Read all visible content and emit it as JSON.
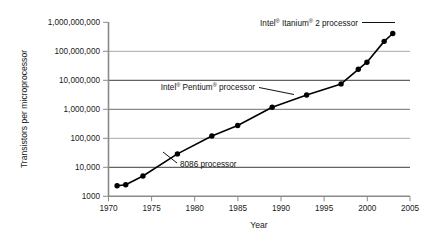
{
  "chart_data": {
    "type": "line",
    "title": "",
    "subtitle": "",
    "xlabel": "Year",
    "ylabel": "Transistors per microprocessor",
    "xlim": [
      1970,
      2005
    ],
    "ylim": [
      1000,
      1000000000
    ],
    "yscale": "log",
    "xscale": "linear",
    "grid": "horizontal",
    "legend": "none",
    "xticks": [
      "1970",
      "1975",
      "1980",
      "1985",
      "1990",
      "1995",
      "2000",
      "2005"
    ],
    "xtick_values": [
      1970,
      1975,
      1980,
      1985,
      1990,
      1995,
      2000,
      2005
    ],
    "yticks": [
      "1000",
      "10,000",
      "100,000",
      "1,000,000",
      "10,000,000",
      "100,000,000",
      "1,000,000,000"
    ],
    "ytick_values": [
      1000,
      10000,
      100000,
      1000000,
      10000000,
      100000000,
      1000000000
    ],
    "series": [
      {
        "name": "Transistors per microprocessor",
        "marker": "filled-circle",
        "color": "#000000",
        "x": [
          1971,
          1972,
          1974,
          1978,
          1982,
          1985,
          1989,
          1993,
          1997,
          1999,
          2000,
          2002,
          2003
        ],
        "y": [
          2300,
          2500,
          5000,
          29000,
          120000,
          275000,
          1180000,
          3100000,
          7500000,
          24000000,
          42000000,
          220000000,
          410000000
        ]
      }
    ],
    "annotations": [
      {
        "id": "itanium",
        "text_parts": [
          "Intel",
          "®",
          " Itanium",
          "®",
          " 2 processor"
        ],
        "text": "Intel® Itanium® 2 processor",
        "points_to_year": 2003,
        "points_to_value": 410000000
      },
      {
        "id": "pentium",
        "text_parts": [
          "Intel",
          "®",
          " Pentium",
          "®",
          " processor"
        ],
        "text": "Intel® Pentium® processor",
        "points_to_year": 1993,
        "points_to_value": 3100000
      },
      {
        "id": "p8086",
        "text_parts": [
          "8086 processor"
        ],
        "text": "8086 processor",
        "points_to_year": 1978,
        "points_to_value": 29000
      }
    ],
    "colors": {
      "line": "#000000",
      "marker": "#000000",
      "axis": "#808080",
      "gridline_light": "#a6a6a6",
      "gridline_dark": "#404040",
      "text": "#1a1a1a",
      "background": "#ffffff"
    }
  },
  "annotation_labels": {
    "itanium_a": "Intel",
    "itanium_reg1": "®",
    "itanium_b": " Itanium",
    "itanium_reg2": "®",
    "itanium_c": " 2 processor",
    "pentium_a": "Intel",
    "pentium_reg1": "®",
    "pentium_b": " Pentium",
    "pentium_reg2": "®",
    "pentium_c": " processor",
    "p8086": "8086 processor"
  },
  "axis_titles": {
    "x": "Year",
    "y": "Transistors per microprocessor"
  }
}
